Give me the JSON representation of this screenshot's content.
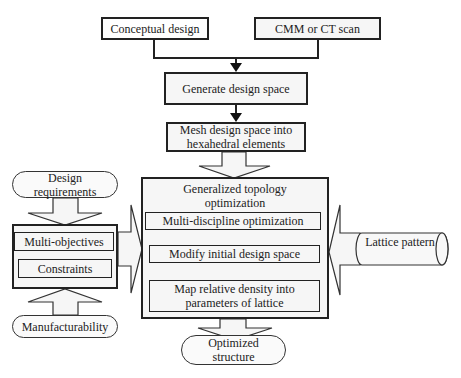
{
  "diagram": {
    "top_inputs": [
      {
        "id": "conceptual",
        "label": "Conceptual design"
      },
      {
        "id": "cmm",
        "label": "CMM or CT scan"
      }
    ],
    "generate": {
      "label": "Generate design space"
    },
    "mesh": {
      "label": "Mesh design space into hexahedral elements"
    },
    "generalized": {
      "title": "Generalized topology optimization",
      "steps": [
        {
          "label": "Multi-discipline optimization"
        },
        {
          "label": "Modify initial design space"
        },
        {
          "label": "Map relative density into parameters of lattice"
        }
      ]
    },
    "left_block": {
      "input_top": {
        "label": "Design requirements"
      },
      "items": [
        {
          "label": "Multi-objectives"
        },
        {
          "label": "Constraints"
        }
      ],
      "input_bottom": {
        "label": "Manufacturability"
      }
    },
    "right_input": {
      "label": "Lattice pattern"
    },
    "output": {
      "label": "Optimized structure"
    },
    "colors": {
      "stroke": "#222222",
      "fill": "#f6f6f6"
    }
  }
}
